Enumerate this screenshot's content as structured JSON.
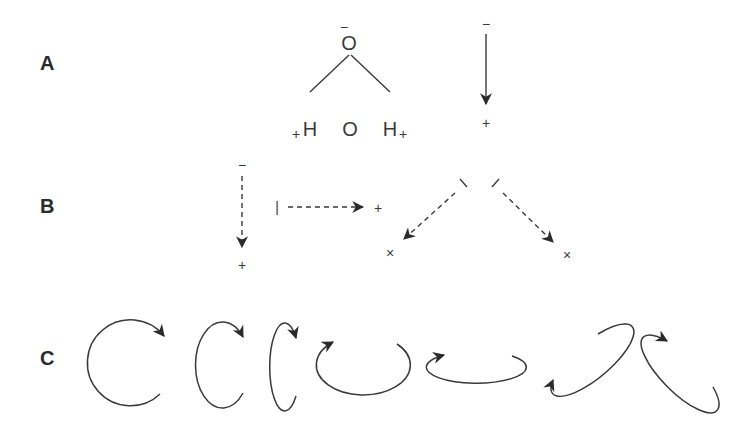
{
  "figure": {
    "panels": [
      {
        "label": "A",
        "water_molecule": {
          "top_atom": "O",
          "top_charge": "−",
          "center_atom": "O",
          "left_atom": "H",
          "left_charge": "+",
          "right_atom": "H",
          "right_charge": "+"
        },
        "dipole_arrow": {
          "style": "solid",
          "start_symbol": "−",
          "end_symbol": "+",
          "direction": "down"
        }
      },
      {
        "label": "B",
        "dipole_arrows": [
          {
            "style": "dashed",
            "start_symbol": "−",
            "end_symbol": "+",
            "direction": "down"
          },
          {
            "style": "dashed",
            "start_symbol": "|",
            "end_symbol": "+",
            "direction": "right"
          },
          {
            "style": "dashed",
            "start_symbol": "\\",
            "end_symbol": "×",
            "direction": "down-left"
          },
          {
            "style": "dashed",
            "start_symbol": "/",
            "end_symbol": "×",
            "direction": "down-right"
          }
        ]
      },
      {
        "label": "C",
        "rotation_arrows": [
          {
            "shape": "circle",
            "direction": "clockwise"
          },
          {
            "shape": "tall-ellipse",
            "direction": "clockwise"
          },
          {
            "shape": "narrow-ellipse",
            "direction": "clockwise"
          },
          {
            "shape": "wide-ellipse",
            "direction": "counterclockwise"
          },
          {
            "shape": "flat-ellipse",
            "direction": "counterclockwise"
          },
          {
            "shape": "tilted-ellipse-right",
            "direction": "counterclockwise"
          },
          {
            "shape": "tilted-ellipse-left",
            "direction": "clockwise"
          }
        ]
      }
    ]
  },
  "colors": {
    "ink": "#3a3a3a",
    "label": "#2b2b2b",
    "background": "#ffffff"
  }
}
